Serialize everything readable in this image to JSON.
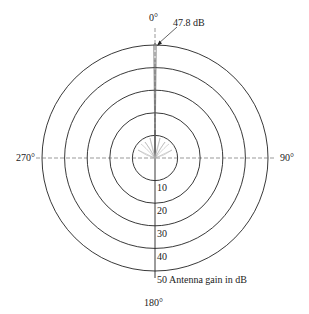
{
  "diagram": {
    "type": "polar-antenna-pattern",
    "angle_labels": {
      "top": "0°",
      "right": "90°",
      "bottom": "180°",
      "left": "270°"
    },
    "peak_annotation": "47.8 dB",
    "ring_labels": [
      "10",
      "20",
      "30",
      "40",
      "50 Antenna gain in dB"
    ],
    "center": [
      155,
      158
    ],
    "ring_radii": [
      22.6,
      45.2,
      67.8,
      90.4,
      113
    ]
  }
}
